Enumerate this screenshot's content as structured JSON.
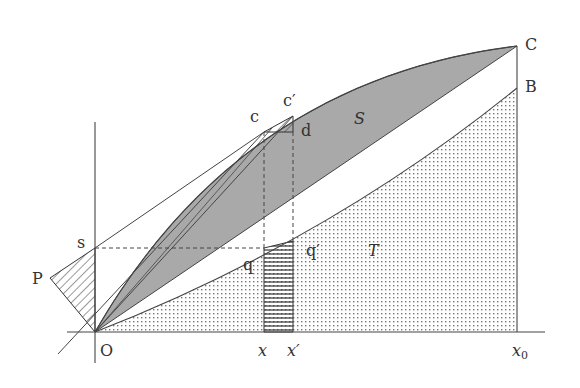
{
  "diagram": {
    "colors": {
      "stroke": "#444444",
      "shaded_S": "#a9a9a9",
      "dots": "#777777",
      "background": "#ffffff"
    },
    "points": {
      "O": "O",
      "P": "P",
      "s": "s",
      "c": "c",
      "c_prime": "c′",
      "d": "d",
      "q": "q",
      "q_prime": "q′",
      "C": "C",
      "B": "B"
    },
    "regions": {
      "S": "S",
      "T": "T"
    },
    "axis_labels": {
      "origin": "O",
      "x": "x",
      "x_prime": "x′",
      "x0": "x",
      "x0_sub": "0"
    }
  }
}
